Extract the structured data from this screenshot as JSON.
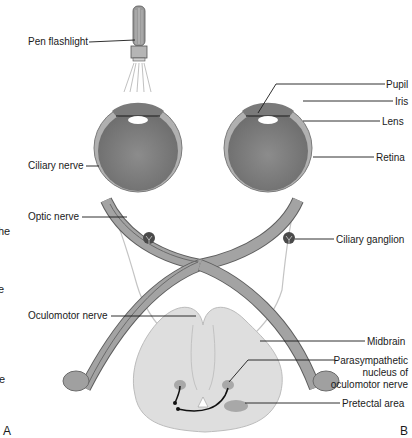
{
  "figure": {
    "colors": {
      "eye_outer": "#a9a9a9",
      "eye_inner": "#7f7f7f",
      "nerve": "#9a9a9a",
      "nerve_outline": "#5e5e5e",
      "midbrain": "#dcdcdc",
      "ganglion": "#4a4a4a",
      "leader_line": "#1a1a1a"
    },
    "labels": {
      "pen_flashlight": "Pen flashlight",
      "ciliary_nerve": "Ciliary nerve",
      "optic_nerve": "Optic nerve",
      "oculomotor_nerve": "Oculomotor nerve",
      "pupil": "Pupil",
      "iris": "Iris",
      "lens": "Lens",
      "retina": "Retina",
      "ciliary_ganglion": "Ciliary ganglion",
      "midbrain": "Midbrain",
      "parasympathetic_line1": "Parasympathetic",
      "parasympathetic_line2": "nucleus of",
      "parasympathetic_line3": "oculomotor nerve",
      "pretectal_area": "Pretectal area"
    },
    "panel_labels": {
      "a": "A",
      "b": "B"
    },
    "cut_off_text": {
      "frag1": "he",
      "frag2": "e",
      "frag3": "te"
    }
  }
}
